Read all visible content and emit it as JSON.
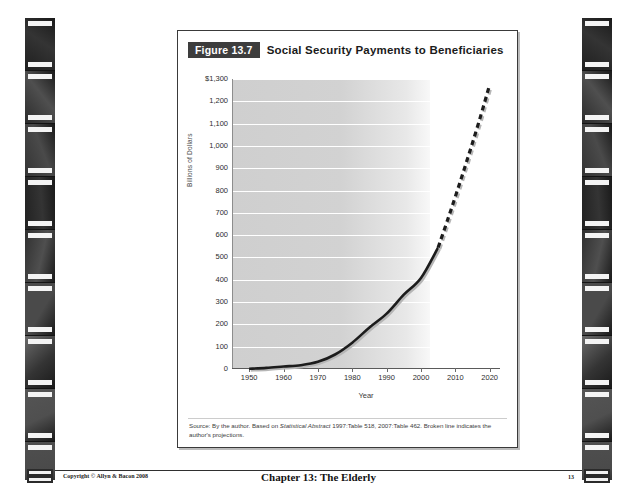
{
  "slide": {
    "figure_badge": "Figure 13.7",
    "figure_title": "Social Security Payments to Beneficiaries",
    "source_prefix": "Source:",
    "source_text_1": " By the author. Based on ",
    "source_italic": "Statistical Abstract",
    "source_text_2": " 1997:Table 518, 2007:Table 462. Broken line indicates the author's projections."
  },
  "footer": {
    "copyright": "Copyright © Allyn & Bacon 2008",
    "chapter": "Chapter 13: The Elderly",
    "page": "13"
  },
  "chart_data": {
    "type": "line",
    "title": "Social Security Payments to Beneficiaries",
    "xlabel": "Year",
    "ylabel": "Billions of Dollars",
    "xlim": [
      1945,
      2023
    ],
    "ylim": [
      0,
      1300
    ],
    "grid": true,
    "legend": "none",
    "ytick_labels": [
      "$1,300",
      "1,200",
      "1,100",
      "1,000",
      "900",
      "800",
      "700",
      "600",
      "500",
      "400",
      "300",
      "200",
      "100",
      "0"
    ],
    "ytick_values": [
      1300,
      1200,
      1100,
      1000,
      900,
      800,
      700,
      600,
      500,
      400,
      300,
      200,
      100,
      0
    ],
    "xtick_labels": [
      "1950",
      "1960",
      "1970",
      "1980",
      "1990",
      "2000",
      "2010",
      "2020"
    ],
    "xtick_values": [
      1950,
      1960,
      1970,
      1980,
      1990,
      2000,
      2010,
      2020
    ],
    "series": [
      {
        "name": "Actual payments",
        "style": "solid",
        "x": [
          1950,
          1955,
          1960,
          1965,
          1970,
          1975,
          1980,
          1985,
          1990,
          1995,
          2000,
          2005
        ],
        "values": [
          1,
          5,
          11,
          17,
          32,
          65,
          118,
          186,
          248,
          333,
          408,
          545
        ]
      },
      {
        "name": "Author's projections",
        "style": "dashed",
        "x": [
          2005,
          2008,
          2011,
          2014,
          2017,
          2020
        ],
        "values": [
          545,
          680,
          820,
          965,
          1115,
          1275
        ]
      }
    ]
  }
}
